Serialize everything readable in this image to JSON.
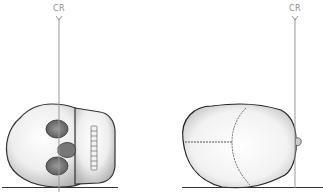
{
  "figures": [
    {
      "id": "left",
      "label": "CR",
      "view": "skull-vertex-view-face-right"
    },
    {
      "id": "right",
      "label": "CR",
      "view": "skull-vertex-view"
    }
  ],
  "colors": {
    "line": "#999999",
    "outline": "#333333",
    "ground": "#333333"
  }
}
